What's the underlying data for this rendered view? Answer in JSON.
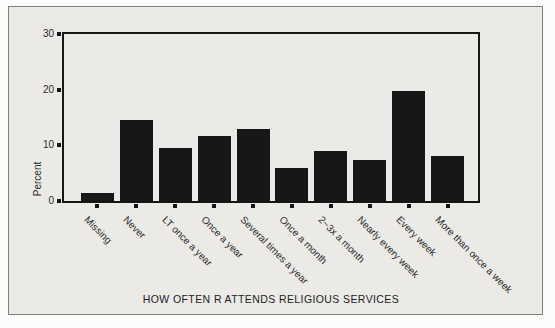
{
  "chart_data": {
    "type": "bar",
    "title": "HOW OFTEN R ATTENDS RELIGIOUS SERVICES",
    "xlabel": "HOW OFTEN R ATTENDS RELIGIOUS SERVICES",
    "ylabel": "Percent",
    "ylim": [
      0,
      30
    ],
    "yticks": [
      0,
      10,
      20,
      30
    ],
    "categories": [
      "Missing",
      "Never",
      "LT once a year",
      "Once a year",
      "Several times a year",
      "Once a month",
      "2~3x a month",
      "Nearly every week",
      "Every week",
      "More than once a week"
    ],
    "values": [
      1.5,
      14.5,
      9.6,
      11.6,
      13.0,
      5.9,
      8.9,
      7.4,
      19.7,
      8.1
    ],
    "grid": false,
    "legend": false,
    "bar_color": "#171717",
    "axis_color": "#161616",
    "panel_background": "#ebeae7",
    "page_background": "#fbfbf9",
    "panel_border_color": "#7f7f7f",
    "text_color": "#2b2b2b"
  }
}
